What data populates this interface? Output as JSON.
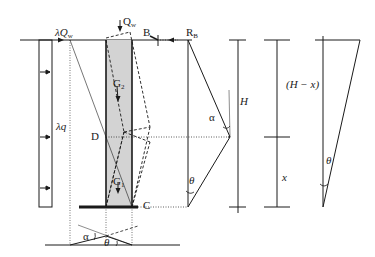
{
  "diagram": {
    "labels": {
      "lambda_qw": "λQ",
      "lambda_qw_sub": "w",
      "qw": "Q",
      "qw_sub": "w",
      "b": "B",
      "rb": "R",
      "rb_sub": "B",
      "g2": "G",
      "g2_sub": "2",
      "g1": "G",
      "g1_sub": "1",
      "d": "D",
      "c": "C",
      "lambda_q": "λq",
      "alpha_right": "α",
      "theta_right": "θ",
      "h": "H",
      "h_minus_x": "(H − x)",
      "x": "x",
      "theta_triangle": "θ",
      "alpha_bottom": "α",
      "theta_bottom": "θ"
    },
    "colors": {
      "stroke": "#1a1a1a",
      "column_fill": "#d3d3d3"
    }
  }
}
